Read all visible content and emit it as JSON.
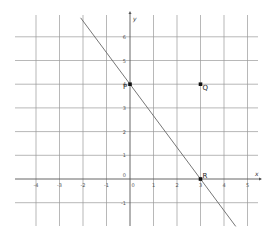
{
  "chart_data": {
    "type": "line",
    "title": "",
    "xlabel": "x",
    "ylabel": "y",
    "xlim": [
      -5,
      5.5
    ],
    "ylim": [
      -2,
      7
    ],
    "grid": true,
    "x_ticks": [
      "-4",
      "-3",
      "-2",
      "-1",
      "0",
      "1",
      "2",
      "3",
      "4",
      "5"
    ],
    "y_ticks": [
      "-1",
      "0",
      "1",
      "2",
      "3",
      "4",
      "5",
      "6"
    ],
    "series": [
      {
        "name": "line through P and R",
        "equation": "y = -4/3 x + 4",
        "x": [
          -2.1,
          4.5
        ],
        "y": [
          6.8,
          -2.0
        ]
      }
    ],
    "points": [
      {
        "label": "P",
        "x": 0,
        "y": 4
      },
      {
        "label": "Q",
        "x": 3,
        "y": 4
      },
      {
        "label": "R",
        "x": 3,
        "y": 0
      }
    ]
  },
  "labels": {
    "x_axis": "x",
    "y_axis": "y",
    "origin": "0",
    "P": "P",
    "Q": "Q",
    "R": "R"
  },
  "colors": {
    "grid": "#9a9a9a",
    "axis": "#555555",
    "line": "#666666",
    "point": "#111111"
  }
}
